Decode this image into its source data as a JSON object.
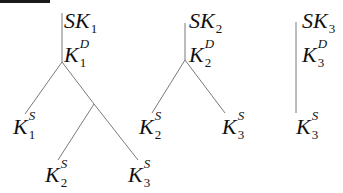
{
  "diagram": {
    "colors": {
      "edge": "#7a7a7a",
      "text": "#111111",
      "top_bar": "#1a1a1a"
    },
    "trees": [
      {
        "id": "tree-1",
        "root": {
          "base": "SK",
          "sub": "1"
        },
        "internal": {
          "base": "K",
          "sup": "D",
          "sub": "1"
        },
        "leaves": [
          {
            "base": "K",
            "sup": "S",
            "sub": "1"
          },
          {
            "base": "K",
            "sup": "S",
            "sub": "2"
          },
          {
            "base": "K",
            "sup": "S",
            "sub": "3"
          }
        ]
      },
      {
        "id": "tree-2",
        "root": {
          "base": "SK",
          "sub": "2"
        },
        "internal": {
          "base": "K",
          "sup": "D",
          "sub": "2"
        },
        "leaves": [
          {
            "base": "K",
            "sup": "S",
            "sub": "2"
          },
          {
            "base": "K",
            "sup": "S",
            "sub": "3"
          }
        ]
      },
      {
        "id": "tree-3",
        "root": {
          "base": "SK",
          "sub": "3"
        },
        "internal": {
          "base": "K",
          "sup": "D",
          "sub": "3"
        },
        "leaves": [
          {
            "base": "K",
            "sup": "S",
            "sub": "3"
          }
        ]
      }
    ]
  }
}
